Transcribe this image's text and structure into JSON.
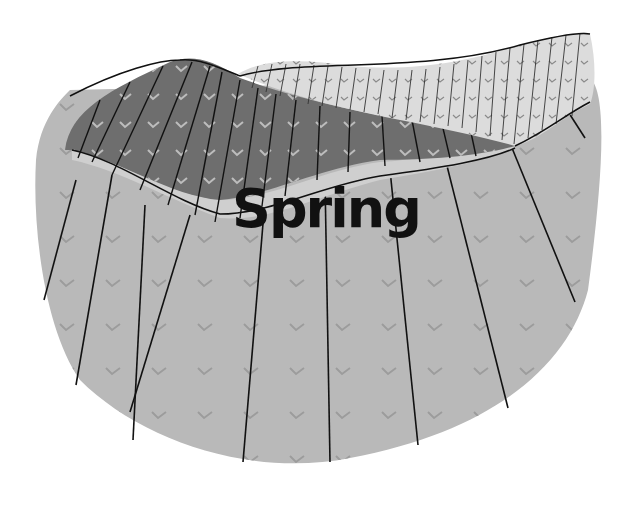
{
  "diagram": {
    "label": "Spring",
    "colors": {
      "background": "#ffffff",
      "base_layer": "#b9b9b9",
      "dark_layer": "#6e6e6e",
      "light_band": "#cfcfcf",
      "hatched_layer": "#dcdcdc",
      "lines": "#111111",
      "ticks_dark": "#bdbdbd",
      "ticks_light": "#9a9a9a"
    },
    "layers": [
      {
        "name": "upper-hatched-layer",
        "pattern": "vertical-lines-with-v-marks"
      },
      {
        "name": "dark-layer",
        "pattern": "fractured-with-v-marks"
      },
      {
        "name": "base-layer",
        "pattern": "radial-fractures-with-v-marks"
      }
    ]
  }
}
